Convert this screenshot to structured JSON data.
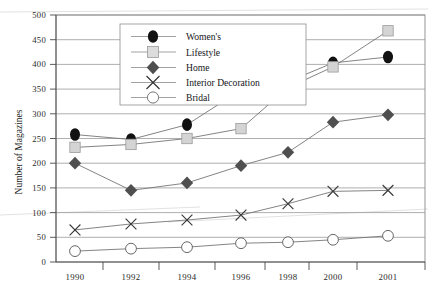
{
  "chart_data": {
    "type": "line",
    "title": "",
    "xlabel": "",
    "ylabel": "Number of Magazines",
    "x": [
      "1990",
      "1992",
      "1994",
      "1996",
      "1998",
      "2000",
      "2001"
    ],
    "categories": [
      "1990",
      "1992",
      "1994",
      "1996",
      "1998",
      "2000",
      "2001"
    ],
    "ylim": [
      0,
      500
    ],
    "yticks": [
      0,
      50,
      100,
      150,
      200,
      250,
      300,
      350,
      400,
      450,
      500
    ],
    "ytick_labels": [
      "0",
      "50",
      "100",
      "150",
      "200",
      "250",
      "300",
      "350",
      "400",
      "450",
      "500"
    ],
    "grid": true,
    "legend_position": "upper-left-inside",
    "series": [
      {
        "name": "Women's",
        "marker": "filled-ellipse",
        "color": "#111111",
        "values": [
          258,
          248,
          278,
          348,
          365,
          403,
          415
        ]
      },
      {
        "name": "Lifestyle",
        "marker": "light-square",
        "color": "#d4d4d4",
        "values": [
          232,
          238,
          250,
          270,
          353,
          395,
          468
        ]
      },
      {
        "name": "Home",
        "marker": "filled-diamond",
        "color": "#4f4f4f",
        "values": [
          200,
          145,
          160,
          195,
          222,
          283,
          298
        ]
      },
      {
        "name": "Interior Decoration",
        "marker": "cross-x",
        "color": "#3a3a3a",
        "values": [
          65,
          77,
          85,
          95,
          118,
          143,
          145
        ]
      },
      {
        "name": "Bridal",
        "marker": "open-circle",
        "color": "#ffffff",
        "values": [
          22,
          27,
          30,
          38,
          40,
          45,
          53
        ]
      }
    ]
  },
  "axis": {
    "y_title": "Number of Magazines"
  },
  "legend": {
    "entries": [
      {
        "label": "Women's"
      },
      {
        "label": "Lifestyle"
      },
      {
        "label": "Home"
      },
      {
        "label": "Interior Decoration"
      },
      {
        "label": "Bridal"
      }
    ]
  },
  "yticks": {
    "t0": "0",
    "t50": "50",
    "t100": "100",
    "t150": "150",
    "t200": "200",
    "t250": "250",
    "t300": "300",
    "t350": "350",
    "t400": "400",
    "t450": "450",
    "t500": "500"
  },
  "xticks": {
    "x1990": "1990",
    "x1992": "1992",
    "x1994": "1994",
    "x1996": "1996",
    "x1998": "1998",
    "x2000": "2000",
    "x2001": "2001"
  }
}
